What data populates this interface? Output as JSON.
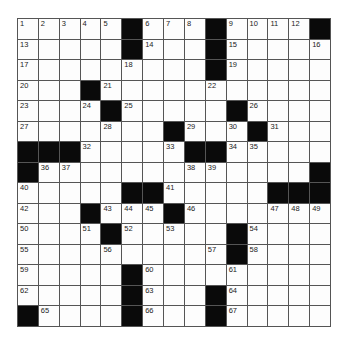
{
  "puzzle": {
    "rows": 15,
    "cols": 15,
    "grid": [
      [
        "1",
        "2",
        "3",
        "4",
        "5",
        "#",
        "6",
        "7",
        "8",
        "#",
        "9",
        "10",
        "11",
        "12",
        "#"
      ],
      [
        "13",
        "",
        "",
        "",
        "",
        "#",
        "14",
        "",
        "",
        "#",
        "15",
        "",
        "",
        "",
        "16"
      ],
      [
        "17",
        "",
        "",
        "",
        "",
        "18",
        "",
        "",
        "",
        "#",
        "19",
        "",
        "",
        "",
        ""
      ],
      [
        "20",
        "",
        "",
        "#",
        "21",
        "",
        "",
        "",
        "",
        "22",
        "",
        "",
        "",
        "",
        ""
      ],
      [
        "23",
        "",
        "",
        "24",
        "#",
        "25",
        "",
        "",
        "",
        "",
        "#",
        "26",
        "",
        "",
        ""
      ],
      [
        "27",
        "",
        "",
        "",
        "28",
        "",
        "",
        "#",
        "29",
        "",
        "30",
        "#",
        "31",
        "",
        ""
      ],
      [
        "#",
        "#",
        "#",
        "32",
        "",
        "",
        "",
        "33",
        "#",
        "#",
        "34",
        "35",
        "",
        "",
        ""
      ],
      [
        "#",
        "36",
        "37",
        "",
        "",
        "",
        "",
        "",
        "38",
        "39",
        "",
        "",
        "",
        "",
        "#"
      ],
      [
        "40",
        "",
        "",
        "",
        "",
        "#",
        "#",
        "41",
        "",
        "",
        "",
        "",
        "#",
        "#",
        "#"
      ],
      [
        "42",
        "",
        "",
        "#",
        "43",
        "44",
        "45",
        "#",
        "46",
        "",
        "",
        "",
        "47",
        "48",
        "49"
      ],
      [
        "50",
        "",
        "",
        "51",
        "#",
        "52",
        "",
        "53",
        "",
        "",
        "#",
        "54",
        "",
        "",
        ""
      ],
      [
        "55",
        "",
        "",
        "",
        "56",
        "",
        "",
        "",
        "",
        "57",
        "#",
        "58",
        "",
        "",
        ""
      ],
      [
        "59",
        "",
        "",
        "",
        "",
        "#",
        "60",
        "",
        "",
        "",
        "61",
        "",
        "",
        "",
        ""
      ],
      [
        "62",
        "",
        "",
        "",
        "",
        "#",
        "63",
        "",
        "",
        "#",
        "64",
        "",
        "",
        "",
        ""
      ],
      [
        "#",
        "65",
        "",
        "",
        "",
        "#",
        "66",
        "",
        "",
        "#",
        "67",
        "",
        "",
        "",
        ""
      ]
    ]
  },
  "colors": {
    "block": "#0a0a0a",
    "cell": "#fdfdfd",
    "line": "#555555"
  }
}
